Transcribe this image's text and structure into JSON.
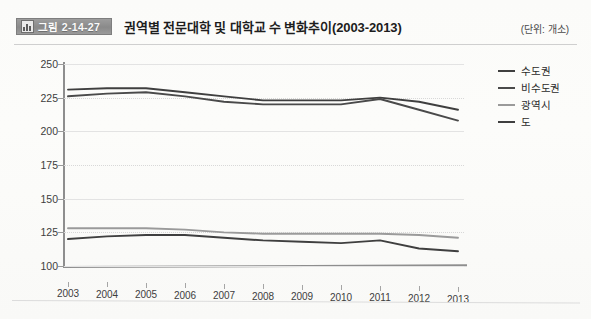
{
  "header": {
    "badge_label": "그림 2-14-27",
    "badge_icon": "bar-chart-icon",
    "title": "권역별 전문대학 및 대학교 수 변화추이(2003-2013)",
    "unit": "(단위: 개소)"
  },
  "chart_data": {
    "type": "line",
    "title": "권역별 전문대학 및 대학교 수 변화추이(2003-2013)",
    "xlabel": "",
    "ylabel": "",
    "unit": "개소",
    "categories": [
      "2003",
      "2004",
      "2005",
      "2006",
      "2007",
      "2008",
      "2009",
      "2010",
      "2011",
      "2012",
      "2013"
    ],
    "ylim": [
      100,
      250
    ],
    "ytick_labels": [
      "100",
      "125",
      "150",
      "175",
      "200",
      "225",
      "250"
    ],
    "ytick_values": [
      100,
      125,
      150,
      175,
      200,
      225,
      250
    ],
    "grid": true,
    "legend_position": "right",
    "series": [
      {
        "name": "수도권",
        "color": "#3f3f3f",
        "values": [
          231,
          232,
          232,
          229,
          226,
          223,
          223,
          223,
          225,
          222,
          216
        ]
      },
      {
        "name": "비수도권",
        "color": "#4a4a4a",
        "values": [
          226,
          228,
          229,
          226,
          222,
          220,
          220,
          220,
          224,
          216,
          208
        ]
      },
      {
        "name": "광역시",
        "color": "#9a9a9a",
        "values": [
          128,
          128,
          128,
          127,
          125,
          124,
          124,
          124,
          124,
          123,
          121
        ]
      },
      {
        "name": "도",
        "color": "#3f3f3f",
        "values": [
          120,
          122,
          123,
          123,
          121,
          119,
          118,
          117,
          119,
          113,
          111
        ]
      }
    ]
  },
  "legend": {
    "items": [
      {
        "label": "수도권",
        "color": "#3f3f3f"
      },
      {
        "label": "비수도권",
        "color": "#4a4a4a"
      },
      {
        "label": "광역시",
        "color": "#9a9a9a"
      },
      {
        "label": "도",
        "color": "#3f3f3f"
      }
    ]
  }
}
